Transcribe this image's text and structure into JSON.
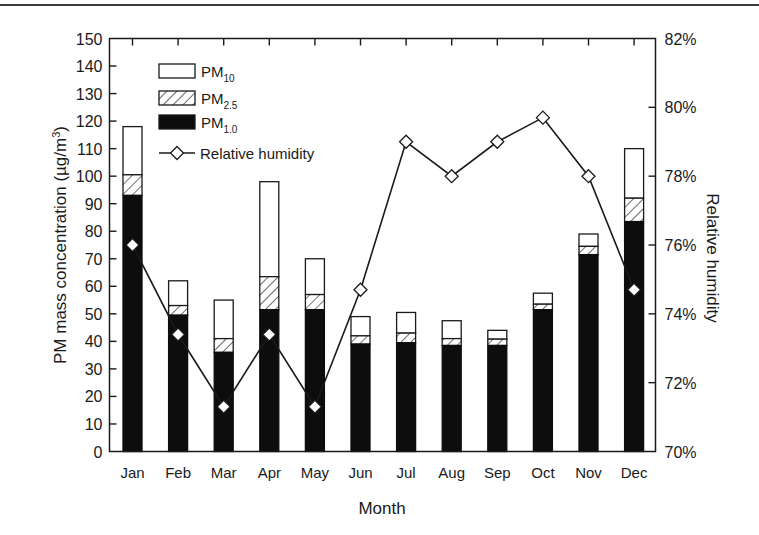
{
  "chart_data": {
    "type": "bar",
    "subtype": "stacked-bar-with-line-secondary-axis",
    "title": "",
    "xlabel": "Month",
    "ylabel": "PM mass concentration (µg/m³)",
    "ylabel_parts": {
      "main": "PM mass concentration (µg/m",
      "sup": "3",
      "end": ")"
    },
    "y2label": "Relative humidity",
    "categories": [
      "Jan",
      "Feb",
      "Mar",
      "Apr",
      "May",
      "Jun",
      "Jul",
      "Aug",
      "Sep",
      "Oct",
      "Nov",
      "Dec"
    ],
    "ylim": [
      0,
      150
    ],
    "yticks": [
      0,
      10,
      20,
      30,
      40,
      50,
      60,
      70,
      80,
      90,
      100,
      110,
      120,
      130,
      140,
      150
    ],
    "y2lim": [
      70,
      82
    ],
    "y2ticks": [
      70,
      72,
      74,
      76,
      78,
      80,
      82
    ],
    "y2tick_labels": [
      "70%",
      "72%",
      "74%",
      "76%",
      "78%",
      "80%",
      "82%"
    ],
    "grid": false,
    "legend_position": "upper-left-inside",
    "series": [
      {
        "name": "PM10",
        "label_main": "PM",
        "label_sub": "10",
        "axis": "left",
        "style": "white-fill",
        "note": "cumulative bar top (total height)",
        "values": [
          118,
          62,
          55,
          98,
          70,
          49,
          50.5,
          47.5,
          44,
          57.5,
          79,
          110
        ]
      },
      {
        "name": "PM2.5",
        "label_main": "PM",
        "label_sub": "2.5",
        "axis": "left",
        "style": "hatched",
        "note": "cumulative top of hatched segment",
        "values": [
          100.5,
          53,
          41,
          63.5,
          57,
          42,
          43,
          41,
          40.8,
          53.5,
          74.5,
          92
        ]
      },
      {
        "name": "PM1.0",
        "label_main": "PM",
        "label_sub": "1.0",
        "axis": "left",
        "style": "black-fill",
        "values": [
          93,
          49.5,
          36,
          51.5,
          51.5,
          39,
          39.5,
          38.5,
          38.5,
          51.5,
          71.5,
          83.5
        ]
      },
      {
        "name": "Relative humidity",
        "axis": "right",
        "type": "line",
        "marker": "diamond",
        "values": [
          76.0,
          73.4,
          71.3,
          73.4,
          71.3,
          74.7,
          79.0,
          78.0,
          79.0,
          79.7,
          78.0,
          74.7
        ]
      }
    ]
  }
}
